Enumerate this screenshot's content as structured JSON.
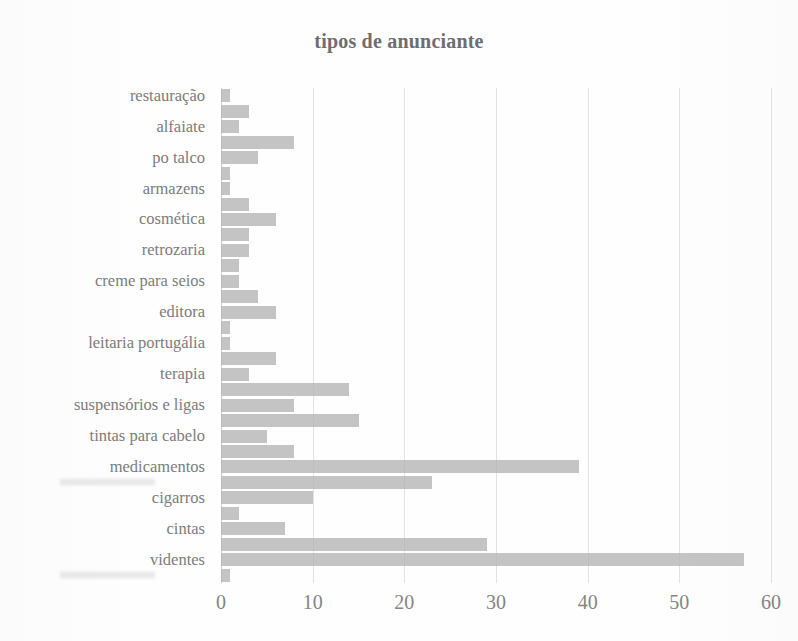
{
  "chart_data": {
    "type": "bar",
    "orientation": "horizontal",
    "title": "tipos de anunciante",
    "xlabel": "",
    "ylabel": "",
    "xlim": [
      0,
      60
    ],
    "ylim": null,
    "grid": true,
    "gridlines_axis": "x",
    "legend": false,
    "legend_position": "none",
    "bar_color": "#b4b4b4",
    "text_color": "#7c7c7c",
    "xticks": [
      0,
      10,
      20,
      30,
      40,
      50,
      60
    ],
    "xtick_labels": [
      "0",
      "10",
      "20",
      "30",
      "40",
      "50",
      "60"
    ],
    "categories": [
      "restauração",
      "",
      "alfaiate",
      "",
      "po talco",
      "",
      "armazens",
      "",
      "cosmética",
      "",
      "retrozaria",
      "",
      "creme para seios",
      "",
      "editora",
      "",
      "leitaria portugália",
      "",
      "terapia",
      "",
      "suspensórios e ligas",
      "",
      "tintas para cabelo",
      "",
      "medicamentos",
      "[ilegível]",
      "cigarros",
      "",
      "cintas",
      "",
      "videntes",
      "[ilegível]"
    ],
    "values": [
      1,
      3,
      2,
      8,
      4,
      1,
      1,
      3,
      6,
      3,
      3,
      2,
      2,
      4,
      6,
      1,
      1,
      6,
      3,
      14,
      8,
      15,
      5,
      8,
      39,
      23,
      10,
      2,
      7,
      29,
      57,
      1
    ],
    "labeled_categories": [
      "restauração",
      "alfaiate",
      "po talco",
      "armazens",
      "cosmética",
      "retrozaria",
      "creme para seios",
      "editora",
      "leitaria portugália",
      "terapia",
      "suspensórios e ligas",
      "tintas para cabelo",
      "medicamentos",
      "cigarros",
      "cintas",
      "videntes"
    ]
  },
  "axis": {
    "x_min": 0,
    "x_max": 60,
    "tick_step": 10
  }
}
